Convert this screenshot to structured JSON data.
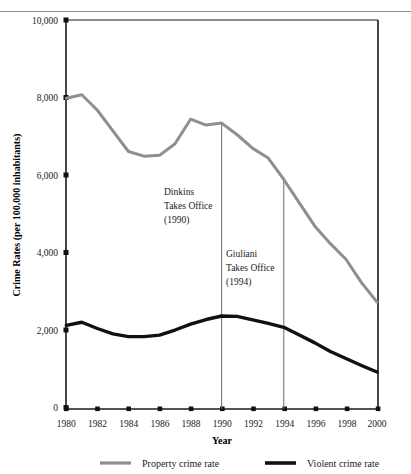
{
  "chart_data": {
    "type": "line",
    "title": "",
    "xlabel": "Year",
    "ylabel": "Crime Rates (per 100,000 inhabitants)",
    "x": [
      1980,
      1981,
      1982,
      1983,
      1984,
      1985,
      1986,
      1987,
      1988,
      1989,
      1990,
      1991,
      1992,
      1993,
      1994,
      1995,
      1996,
      1997,
      1998,
      1999,
      2000
    ],
    "xlim": [
      1980,
      2000
    ],
    "ylim": [
      0,
      10000
    ],
    "xticks": [
      "1980",
      "1982",
      "1984",
      "1986",
      "1988",
      "1990",
      "1992",
      "1994",
      "1996",
      "1998",
      "2000"
    ],
    "yticks": [
      "0",
      "2,000",
      "4,000",
      "6,000",
      "8,000",
      "10,000"
    ],
    "grid": false,
    "legend_position": "bottom",
    "series": [
      {
        "name": "Property crime rate",
        "color": "#8f8f8f",
        "values": [
          7990,
          8080,
          7680,
          7150,
          6620,
          6500,
          6520,
          6820,
          7450,
          7300,
          7350,
          7050,
          6700,
          6450,
          5900,
          5300,
          4700,
          4250,
          3850,
          3250,
          2750
        ]
      },
      {
        "name": "Violent crime rate",
        "color": "#111111",
        "values": [
          2150,
          2230,
          2070,
          1930,
          1860,
          1860,
          1900,
          2030,
          2180,
          2300,
          2390,
          2380,
          2290,
          2200,
          2100,
          1900,
          1700,
          1480,
          1300,
          1120,
          950
        ]
      }
    ],
    "annotations": [
      {
        "name": "dinkins",
        "year": 1990,
        "lines": [
          "Dinkins",
          "Takes Office",
          "(1990)"
        ]
      },
      {
        "name": "giuliani",
        "year": 1994,
        "lines": [
          "Giuliani",
          "Takes Office",
          "(1994)"
        ]
      }
    ]
  },
  "axes": {
    "y_title": "Crime Rates (per 100,000 inhabitants)",
    "x_title": "Year",
    "y_ticks": [
      "10,000",
      "8,000",
      "6,000",
      "4,000",
      "2,000",
      "0"
    ],
    "x_ticks": [
      "1980",
      "1982",
      "1984",
      "1986",
      "1988",
      "1990",
      "1992",
      "1994",
      "1996",
      "1998",
      "2000"
    ]
  },
  "annotations": {
    "dinkins": {
      "line1": "Dinkins",
      "line2": "Takes Office",
      "line3": "(1990)"
    },
    "giuliani": {
      "line1": "Giuliani",
      "line2": "Takes Office",
      "line3": "(1994)"
    }
  },
  "legend": {
    "items": [
      {
        "label": "Property crime rate",
        "color": "#8f8f8f"
      },
      {
        "label": "Violent crime rate",
        "color": "#111111"
      }
    ]
  },
  "colors": {
    "property": "#8f8f8f",
    "violent": "#111111",
    "axis": "#1a1a1a",
    "annotation_line": "#666666",
    "background": "#ffffff"
  }
}
